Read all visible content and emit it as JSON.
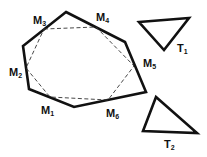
{
  "diagram": {
    "hexagon": {
      "vertices": [
        [
          66,
          12
        ],
        [
          125,
          42
        ],
        [
          146,
          92
        ],
        [
          74,
          107
        ],
        [
          29,
          89
        ],
        [
          23,
          46
        ]
      ],
      "stroke": "#111111"
    },
    "midpoint_hexagon": {
      "points": [
        [
          44,
          29
        ],
        [
          96,
          27
        ],
        [
          134,
          66
        ],
        [
          108,
          100
        ],
        [
          50,
          97
        ],
        [
          26,
          68
        ]
      ],
      "style": "dashed"
    },
    "midpoints": [
      {
        "name": "M",
        "sub": "1",
        "x": 41,
        "y": 114
      },
      {
        "name": "M",
        "sub": "2",
        "x": 9,
        "y": 76
      },
      {
        "name": "M",
        "sub": "3",
        "x": 33,
        "y": 24
      },
      {
        "name": "M",
        "sub": "4",
        "x": 96,
        "y": 21
      },
      {
        "name": "M",
        "sub": "5",
        "x": 143,
        "y": 67
      },
      {
        "name": "M",
        "sub": "6",
        "x": 106,
        "y": 117
      }
    ],
    "triangles": [
      {
        "name": "T",
        "sub": "1",
        "points": [
          [
            139,
            22
          ],
          [
            189,
            18
          ],
          [
            164,
            50
          ]
        ],
        "label_x": 177,
        "label_y": 52
      },
      {
        "name": "T",
        "sub": "2",
        "points": [
          [
            156,
            97
          ],
          [
            143,
            131
          ],
          [
            197,
            133
          ]
        ],
        "label_x": 164,
        "label_y": 148
      }
    ]
  }
}
